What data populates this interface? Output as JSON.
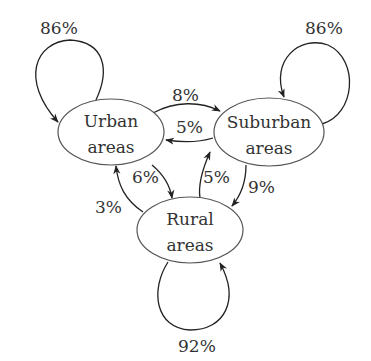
{
  "diagram": {
    "type": "markov-chain",
    "nodes": [
      {
        "id": "urban",
        "line1": "Urban",
        "line2": "areas"
      },
      {
        "id": "suburban",
        "line1": "Suburban",
        "line2": "areas"
      },
      {
        "id": "rural",
        "line1": "Rural",
        "line2": "areas"
      }
    ],
    "edges": [
      {
        "from": "urban",
        "to": "urban",
        "label": "86%"
      },
      {
        "from": "suburban",
        "to": "suburban",
        "label": "86%"
      },
      {
        "from": "rural",
        "to": "rural",
        "label": "92%"
      },
      {
        "from": "urban",
        "to": "suburban",
        "label": "8%"
      },
      {
        "from": "suburban",
        "to": "urban",
        "label": "5%"
      },
      {
        "from": "urban",
        "to": "rural",
        "label": "6%"
      },
      {
        "from": "rural",
        "to": "urban",
        "label": "3%"
      },
      {
        "from": "rural",
        "to": "suburban",
        "label": "5%"
      },
      {
        "from": "suburban",
        "to": "rural",
        "label": "9%"
      }
    ]
  }
}
